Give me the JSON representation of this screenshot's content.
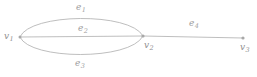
{
  "figure": {
    "type": "multigraph",
    "background_color": "#ffffff",
    "stroke_color": "#b0b0b0",
    "label_color": "#9a9a9a",
    "width": 257,
    "height": 77
  },
  "vertices": [
    {
      "id": "v1",
      "name": "v",
      "subscript": "1",
      "x": 20,
      "y": 37,
      "label_x": 4,
      "label_y": 32
    },
    {
      "id": "v2",
      "name": "v",
      "subscript": "2",
      "x": 143,
      "y": 36,
      "label_x": 144,
      "label_y": 41
    },
    {
      "id": "v3",
      "name": "v",
      "subscript": "3",
      "x": 243,
      "y": 38,
      "label_x": 240,
      "label_y": 43
    }
  ],
  "edges": [
    {
      "id": "e1",
      "name": "e",
      "subscript": "1",
      "from": "v1",
      "to": "v2",
      "shape": "arc-above",
      "label_x": 76,
      "label_y": 3
    },
    {
      "id": "e2",
      "name": "e",
      "subscript": "2",
      "from": "v1",
      "to": "v2",
      "shape": "straight",
      "label_x": 78,
      "label_y": 24
    },
    {
      "id": "e3",
      "name": "e",
      "subscript": "3",
      "from": "v1",
      "to": "v2",
      "shape": "arc-below",
      "label_x": 75,
      "label_y": 59
    },
    {
      "id": "e4",
      "name": "e",
      "subscript": "4",
      "from": "v2",
      "to": "v3",
      "shape": "straight",
      "label_x": 189,
      "label_y": 19
    }
  ]
}
